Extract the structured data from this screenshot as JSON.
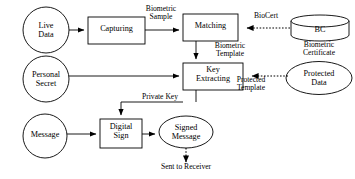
{
  "diagram": {
    "canvas": {
      "width": 355,
      "height": 179
    },
    "style": {
      "stroke_color": "#000000",
      "fill_color": "#ffffff",
      "background": "#ffffff"
    },
    "nodes": [
      {
        "id": "live_data",
        "label": "Live\nData",
        "shape": "circle"
      },
      {
        "id": "capturing",
        "label": "Capturing",
        "shape": "rectangle"
      },
      {
        "id": "matching",
        "label": "Matching",
        "shape": "rectangle"
      },
      {
        "id": "bc",
        "label": "BC",
        "shape": "cylinder"
      },
      {
        "id": "personal_secret",
        "label": "Personal\nSecret",
        "shape": "circle"
      },
      {
        "id": "key_extracting",
        "label": "Key\nExtracting",
        "shape": "rectangle"
      },
      {
        "id": "protected_data",
        "label": "Protected\nData",
        "shape": "ellipse"
      },
      {
        "id": "message",
        "label": "Message",
        "shape": "circle"
      },
      {
        "id": "digital_sign",
        "label": "Digital\nSign",
        "shape": "rectangle"
      },
      {
        "id": "signed_message",
        "label": "Signed\nMessage",
        "shape": "ellipse"
      }
    ],
    "annotations": [
      {
        "id": "bc_caption",
        "label": "Biometric\nCertificate"
      },
      {
        "id": "sent_to_receiver",
        "label": "Sent to Receiver"
      }
    ],
    "edges": [
      {
        "id": "live_to_capturing",
        "from": "live_data",
        "to": "capturing",
        "label": "",
        "style": "solid"
      },
      {
        "id": "capturing_to_matching",
        "from": "capturing",
        "to": "matching",
        "label": "Biometric\nSample",
        "style": "solid"
      },
      {
        "id": "bc_to_matching",
        "from": "bc",
        "to": "matching",
        "label": "BioCert",
        "style": "dotted"
      },
      {
        "id": "matching_to_key",
        "from": "matching",
        "to": "key_extracting",
        "label": "Biometric\nTemplate",
        "style": "solid"
      },
      {
        "id": "secret_to_key",
        "from": "personal_secret",
        "to": "key_extracting",
        "label": "",
        "style": "solid"
      },
      {
        "id": "protected_to_key",
        "from": "protected_data",
        "to": "key_extracting",
        "label": "Protected\nTemplate",
        "style": "dotted"
      },
      {
        "id": "key_to_sign",
        "from": "key_extracting",
        "to": "digital_sign",
        "label": "Private Key",
        "style": "solid"
      },
      {
        "id": "message_to_sign",
        "from": "message",
        "to": "digital_sign",
        "label": "",
        "style": "solid"
      },
      {
        "id": "sign_to_signed",
        "from": "digital_sign",
        "to": "signed_message",
        "label": "",
        "style": "solid"
      },
      {
        "id": "signed_to_receiver",
        "from": "signed_message",
        "to": "sent_to_receiver",
        "label": "",
        "style": "dotted"
      }
    ]
  }
}
